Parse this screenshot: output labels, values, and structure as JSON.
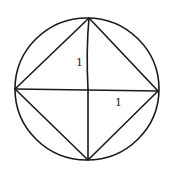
{
  "diagram": {
    "stroke_color": "#1a1a1a",
    "background": "#ffffff",
    "circle": {
      "cx": 87,
      "cy": 89,
      "r": 72
    },
    "square_vertices": {
      "top": [
        89,
        18
      ],
      "right": [
        158,
        91
      ],
      "bottom": [
        88,
        160
      ],
      "left": [
        15,
        89
      ]
    },
    "labels": [
      {
        "text": "1",
        "x": 76,
        "y": 66,
        "refers_to": "vertical half-diameter"
      },
      {
        "text": "1",
        "x": 115,
        "y": 106,
        "refers_to": "horizontal half-diameter"
      }
    ]
  }
}
